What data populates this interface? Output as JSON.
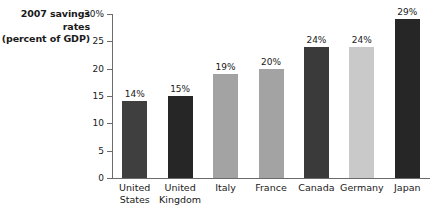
{
  "chart_data": {
    "type": "bar",
    "title": "",
    "axis_title_lines": [
      "2007 savings",
      "rates",
      "(percent of GDP)"
    ],
    "categories": [
      "United States",
      "United Kingdom",
      "Italy",
      "France",
      "Canada",
      "Germany",
      "Japan"
    ],
    "category_lines": [
      [
        "United",
        "States"
      ],
      [
        "United",
        "Kingdom"
      ],
      [
        "Italy"
      ],
      [
        "France"
      ],
      [
        "Canada"
      ],
      [
        "Germany"
      ],
      [
        "Japan"
      ]
    ],
    "values": [
      14,
      15,
      19,
      20,
      24,
      24,
      29
    ],
    "value_labels": [
      "14%",
      "15%",
      "19%",
      "20%",
      "24%",
      "24%",
      "29%"
    ],
    "bar_colors": [
      "#3f3f3f",
      "#262626",
      "#a3a3a3",
      "#a3a3a3",
      "#3a3a3a",
      "#c9c9c9",
      "#262626"
    ],
    "xlabel": "",
    "ylabel": "",
    "ylim": [
      0,
      30
    ],
    "ytick_values": [
      30,
      25,
      20,
      15,
      10,
      5,
      0
    ],
    "ytick_labels": [
      "30%",
      "25",
      "20",
      "15",
      "10",
      "5",
      "0"
    ],
    "grid": false,
    "legend": "none",
    "axis_color": "#6b6b6b",
    "background": "#ffffff"
  }
}
